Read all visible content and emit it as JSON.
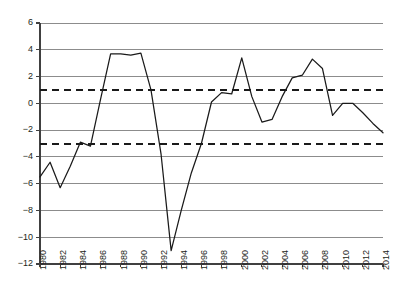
{
  "chart_data": {
    "type": "line",
    "title": "",
    "subtitle": "",
    "xlabel": "",
    "ylabel": "",
    "x": [
      1980,
      1981,
      1982,
      1983,
      1984,
      1985,
      1986,
      1987,
      1988,
      1989,
      1990,
      1991,
      1992,
      1993,
      1994,
      1995,
      1996,
      1997,
      1998,
      1999,
      2000,
      2001,
      2002,
      2003,
      2004,
      2005,
      2006,
      2007,
      2008,
      2009,
      2010,
      2011,
      2012,
      2013,
      2014
    ],
    "values": [
      -5.5,
      -4.4,
      -6.3,
      -4.7,
      -2.9,
      -3.2,
      0.3,
      3.7,
      3.7,
      3.6,
      3.75,
      1.0,
      -3.8,
      -11.0,
      -8.0,
      -5.2,
      -3.0,
      0.1,
      0.8,
      0.7,
      3.4,
      0.5,
      -1.4,
      -1.2,
      0.5,
      1.9,
      2.1,
      3.3,
      2.6,
      -0.9,
      0.0,
      0.0,
      -0.7,
      -1.5,
      -2.2
    ],
    "series": [
      {
        "name": "series-1",
        "color": "#1a1a1a",
        "style": "solid",
        "values": [
          -5.5,
          -4.4,
          -6.3,
          -4.7,
          -2.9,
          -3.2,
          0.3,
          3.7,
          3.7,
          3.6,
          3.75,
          1.0,
          -3.8,
          -11.0,
          -8.0,
          -5.2,
          -3.0,
          0.1,
          0.8,
          0.7,
          3.4,
          0.5,
          -1.4,
          -1.2,
          0.5,
          1.9,
          2.1,
          3.3,
          2.6,
          -0.9,
          0.0,
          0.0,
          -0.7,
          -1.5,
          -2.2
        ]
      }
    ],
    "reference_lines": [
      {
        "name": "upper-threshold",
        "value": 1,
        "style": "dashed",
        "color": "#1a1a1a"
      },
      {
        "name": "lower-threshold",
        "value": -3,
        "style": "dashed",
        "color": "#1a1a1a"
      }
    ],
    "ylim": [
      -12,
      6
    ],
    "xlim": [
      1980,
      2014
    ],
    "ytick_labels": [
      "6",
      "4",
      "2",
      "0",
      "-2",
      "-4",
      "-6",
      "-8",
      "-10",
      "-12"
    ],
    "ytick_values": [
      6,
      4,
      2,
      0,
      -2,
      -4,
      -6,
      -8,
      -10,
      -12
    ],
    "xtick_labels": [
      "1980",
      "1982",
      "1984",
      "1986",
      "1988",
      "1990",
      "1992",
      "1994",
      "1996",
      "1998",
      "2000",
      "2002",
      "2004",
      "2006",
      "2008",
      "2010",
      "2012",
      "2014"
    ],
    "xtick_values": [
      1980,
      1982,
      1984,
      1986,
      1988,
      1990,
      1992,
      1994,
      1996,
      1998,
      2000,
      2002,
      2004,
      2006,
      2008,
      2010,
      2012,
      2014
    ],
    "grid": "horizontal",
    "legend": "none",
    "xtick_rotation": -90,
    "plot_area": {
      "left": 40,
      "right": 383,
      "top": 23,
      "bottom": 264
    },
    "colors": {
      "gridline": "#808080",
      "axis": "#404040",
      "series": "#1a1a1a",
      "background": "#ffffff",
      "text": "#231f20"
    }
  },
  "caption": {
    "text": ""
  }
}
